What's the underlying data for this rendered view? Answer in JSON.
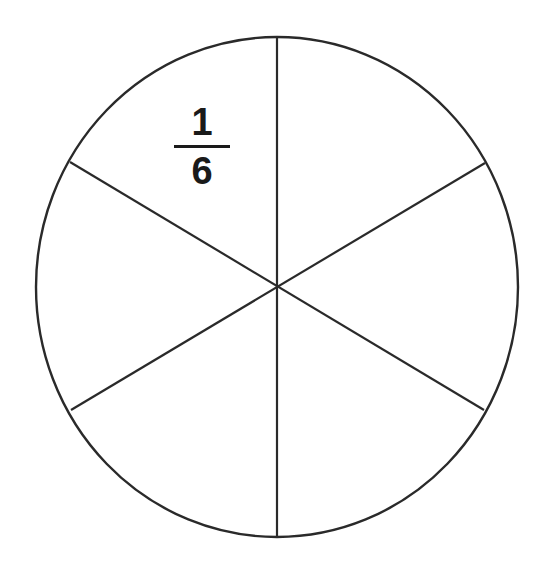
{
  "diagram": {
    "shape": "circle",
    "parts": 6,
    "stroke_color": "#2a2a2a",
    "label": {
      "numerator": "1",
      "denominator": "6",
      "sector": "upper-left"
    }
  }
}
